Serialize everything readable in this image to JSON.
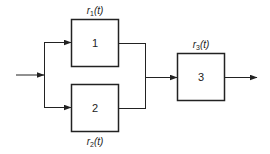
{
  "diagram": {
    "type": "reliability-block-diagram",
    "colors": {
      "stroke": "#222222",
      "background": "#ffffff",
      "text": "#222222"
    },
    "blocks": [
      {
        "id": "1",
        "label": "1",
        "rate_label": {
          "prefix": "r",
          "subscript": "1",
          "suffix": "(t)"
        }
      },
      {
        "id": "2",
        "label": "2",
        "rate_label": {
          "prefix": "r",
          "subscript": "2",
          "suffix": "(t)"
        }
      },
      {
        "id": "3",
        "label": "3",
        "rate_label": {
          "prefix": "r",
          "subscript": "3",
          "suffix": "(t)"
        }
      }
    ],
    "connections": [
      {
        "from": "input",
        "to": "split"
      },
      {
        "from": "split",
        "to": "1"
      },
      {
        "from": "split",
        "to": "2"
      },
      {
        "from": "1",
        "to": "merge"
      },
      {
        "from": "2",
        "to": "merge"
      },
      {
        "from": "merge",
        "to": "3"
      },
      {
        "from": "3",
        "to": "output"
      }
    ]
  }
}
